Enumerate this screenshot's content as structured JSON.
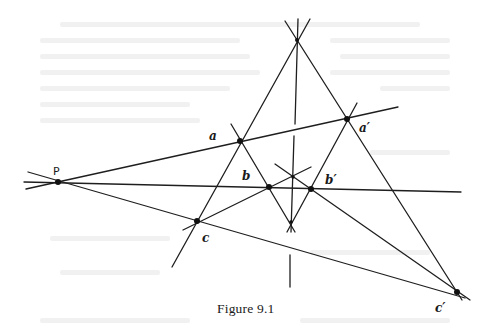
{
  "figure": {
    "caption": "Figure 9.1",
    "stroke_color": "#1e1e1e",
    "points": {
      "O": {
        "x": 297,
        "y": 40
      },
      "P": {
        "x": 58,
        "y": 182,
        "label": "P"
      },
      "a": {
        "x": 240,
        "y": 141,
        "label": "a"
      },
      "a_prime": {
        "x": 347,
        "y": 119,
        "label": "a′"
      },
      "b": {
        "x": 269,
        "y": 187,
        "label": "b"
      },
      "b_prime": {
        "x": 311,
        "y": 189,
        "label": "b′"
      },
      "c": {
        "x": 197,
        "y": 221,
        "label": "c"
      },
      "c_prime": {
        "x": 457,
        "y": 292,
        "label": "c′"
      },
      "q": {
        "x": 293,
        "y": 177
      },
      "r": {
        "x": 291,
        "y": 222
      }
    },
    "labels": {
      "P": "P",
      "a": "a",
      "a_prime": "a′",
      "b": "b",
      "b_prime": "b′",
      "c": "c",
      "c_prime": "c′"
    }
  }
}
